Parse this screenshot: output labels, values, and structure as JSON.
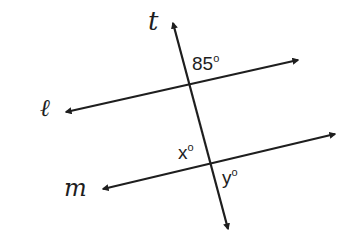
{
  "diagram": {
    "type": "parallel-lines-transversal",
    "colors": {
      "stroke": "#1e1e1e",
      "background": "#ffffff"
    },
    "lines": {
      "l": {
        "label": "ℓ"
      },
      "m": {
        "label": "m"
      },
      "t": {
        "label": "t"
      }
    },
    "angles": {
      "given": {
        "value": "85",
        "unit": "o"
      },
      "x": {
        "value": "x",
        "unit": "o"
      },
      "y": {
        "value": "y",
        "unit": "o"
      }
    }
  }
}
